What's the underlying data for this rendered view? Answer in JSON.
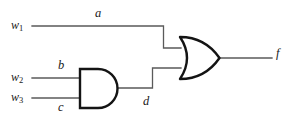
{
  "diagram": {
    "background_color": "#ffffff",
    "gate_outline_color": "#141414",
    "wire_color": "#5a5a5a",
    "label_color": "#1a1a1a"
  },
  "inputs": [
    {
      "name": "w1",
      "base": "w",
      "subscript": "1"
    },
    {
      "name": "w2",
      "base": "w",
      "subscript": "2"
    },
    {
      "name": "w3",
      "base": "w",
      "subscript": "3"
    }
  ],
  "wire_labels": {
    "a": "a",
    "b": "b",
    "c": "c",
    "d": "d"
  },
  "output": {
    "name": "f"
  },
  "gates": [
    {
      "id": "and1",
      "type": "AND",
      "inputs": [
        "b",
        "c"
      ],
      "output": "d"
    },
    {
      "id": "or1",
      "type": "OR",
      "inputs": [
        "a",
        "d"
      ],
      "output": "f"
    }
  ]
}
